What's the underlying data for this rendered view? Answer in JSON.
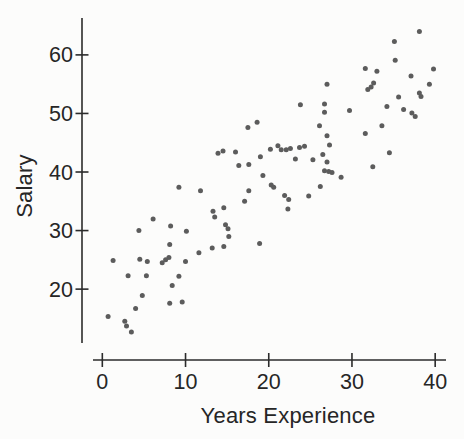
{
  "colors": {
    "background": "#fcfcfb",
    "axis": "#2b2b2b",
    "text": "#262626",
    "point": "#5c5c5c"
  },
  "chart_data": {
    "type": "scatter",
    "title": "",
    "xlabel": "Years Experience",
    "ylabel": "Salary",
    "xticks": [
      0,
      10,
      20,
      30,
      40
    ],
    "yticks": [
      20,
      30,
      40,
      50,
      60
    ],
    "xlim": [
      -1.12,
      41.3
    ],
    "ylim": [
      10.8,
      66.3
    ],
    "grid": false,
    "legend": null,
    "points": [
      [
        27,
        55
      ],
      [
        23.8,
        51.5
      ],
      [
        26.7,
        51.6
      ],
      [
        26.7,
        50.2
      ],
      [
        38.1,
        64
      ],
      [
        35.1,
        62.3
      ],
      [
        35.2,
        59.1
      ],
      [
        31.6,
        57.7
      ],
      [
        33,
        57.2
      ],
      [
        39.8,
        57.6
      ],
      [
        37.1,
        56.4
      ],
      [
        32.6,
        55.2
      ],
      [
        32.3,
        54.5
      ],
      [
        31.9,
        54.1
      ],
      [
        39.3,
        55
      ],
      [
        38.1,
        53.5
      ],
      [
        38.3,
        52.9
      ],
      [
        35.6,
        52.8
      ],
      [
        34.2,
        51.2
      ],
      [
        36.2,
        50.7
      ],
      [
        29.7,
        50.5
      ],
      [
        37.2,
        50.1
      ],
      [
        37.6,
        49.5
      ],
      [
        33.6,
        47.9
      ],
      [
        31.6,
        46.6
      ],
      [
        34.5,
        43.3
      ],
      [
        32.5,
        40.9
      ],
      [
        28.7,
        39.1
      ],
      [
        17.5,
        47.6
      ],
      [
        18.6,
        48.5
      ],
      [
        26.1,
        47.9
      ],
      [
        27,
        46.2
      ],
      [
        27.3,
        44.6
      ],
      [
        20.2,
        43.9
      ],
      [
        21.1,
        44.5
      ],
      [
        21.5,
        43.8
      ],
      [
        22.1,
        43.8
      ],
      [
        22.6,
        44
      ],
      [
        23.7,
        44.2
      ],
      [
        24.3,
        44.4
      ],
      [
        13.9,
        43.2
      ],
      [
        14.5,
        43.6
      ],
      [
        16,
        43.4
      ],
      [
        19,
        42.6
      ],
      [
        26.5,
        43
      ],
      [
        23.2,
        42.2
      ],
      [
        25.3,
        42.1
      ],
      [
        27,
        41.7
      ],
      [
        16.4,
        41.1
      ],
      [
        17.6,
        41.3
      ],
      [
        26.7,
        40.2
      ],
      [
        27.2,
        40.1
      ],
      [
        27.6,
        39.9
      ],
      [
        19.3,
        39.4
      ],
      [
        20.3,
        37.8
      ],
      [
        20.6,
        37.4
      ],
      [
        17.6,
        36.8
      ],
      [
        21.9,
        36
      ],
      [
        22.4,
        35.3
      ],
      [
        26.2,
        37.5
      ],
      [
        24.8,
        35.9
      ],
      [
        17.1,
        35
      ],
      [
        22.3,
        33.7
      ],
      [
        13.3,
        33.3
      ],
      [
        14.6,
        33.9
      ],
      [
        13.5,
        32.3
      ],
      [
        14.8,
        31
      ],
      [
        15.1,
        30.3
      ],
      [
        15.2,
        29
      ],
      [
        14.6,
        27.3
      ],
      [
        13.2,
        27
      ],
      [
        18.9,
        27.8
      ],
      [
        9.2,
        37.4
      ],
      [
        11.8,
        36.8
      ],
      [
        6.1,
        32
      ],
      [
        8.2,
        30.8
      ],
      [
        4.4,
        30
      ],
      [
        10.1,
        29.9
      ],
      [
        11.6,
        26.2
      ],
      [
        8.1,
        27.6
      ],
      [
        1.3,
        24.9
      ],
      [
        4.5,
        25.1
      ],
      [
        5.4,
        24.7
      ],
      [
        7.2,
        24.5
      ],
      [
        7.6,
        25
      ],
      [
        8,
        25.4
      ],
      [
        10,
        24.7
      ],
      [
        3.1,
        22.3
      ],
      [
        5.3,
        22.3
      ],
      [
        9.2,
        22.2
      ],
      [
        8.4,
        20.6
      ],
      [
        4.8,
        18.9
      ],
      [
        8.1,
        17.6
      ],
      [
        9.6,
        17.8
      ],
      [
        4,
        16.7
      ],
      [
        0.7,
        15.3
      ],
      [
        2.7,
        14.5
      ],
      [
        2.9,
        13.7
      ],
      [
        3.5,
        12.7
      ]
    ]
  }
}
